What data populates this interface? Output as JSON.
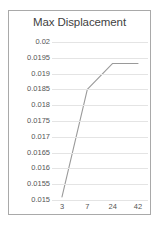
{
  "chart_data": {
    "type": "line",
    "title": "Max Displacement",
    "xlabel": "",
    "ylabel": "",
    "categories": [
      "3",
      "7",
      "24",
      "42"
    ],
    "series": [
      {
        "name": "Max Displacement",
        "values": [
          0.0151,
          0.0185,
          0.01932,
          0.01932
        ],
        "color": "#9a9a9a"
      }
    ],
    "ylim": [
      0.015,
      0.02
    ],
    "yticks": [
      0.02,
      0.0195,
      0.019,
      0.0185,
      0.018,
      0.0175,
      0.017,
      0.0165,
      0.016,
      0.0155,
      0.015
    ],
    "ytick_labels": [
      "0.02",
      "0.0195",
      "0.019",
      "0.0185",
      "0.018",
      "0.0175",
      "0.017",
      "0.0165",
      "0.016",
      "0.0155",
      "0.015"
    ],
    "xtick_labels": [
      "3",
      "7",
      "24",
      "42"
    ],
    "grid": true,
    "grid_axis": "y",
    "grid_color": "#e4e4e4",
    "legend": false,
    "legend_position": "none",
    "background": "#ffffff",
    "border_color": "#a9a9a9",
    "title_color": "#3f3f3f",
    "tick_label_color": "#555555"
  }
}
